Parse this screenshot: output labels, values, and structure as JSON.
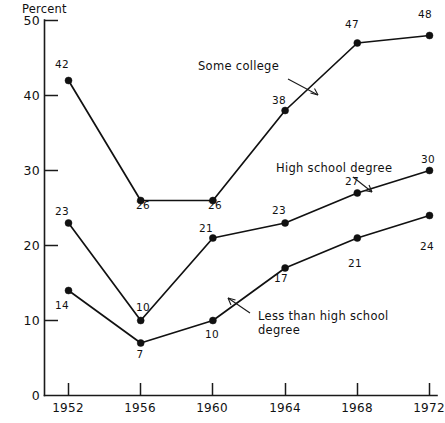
{
  "chart_data": {
    "type": "line",
    "title": "",
    "xlabel": "",
    "ylabel": "Percent",
    "ylim": [
      0,
      50
    ],
    "yticks": [
      0,
      10,
      20,
      30,
      40,
      50
    ],
    "ytick_labels": [
      "0",
      "10",
      "20",
      "30",
      "40",
      "50"
    ],
    "grid": false,
    "legend_position": "inline-annotations",
    "categories": [
      "1952",
      "1956",
      "1960",
      "1964",
      "1968",
      "1972"
    ],
    "x": [
      1952,
      1956,
      1960,
      1964,
      1968,
      1972
    ],
    "series": [
      {
        "name": "Some college",
        "values": [
          42,
          26,
          26,
          38,
          47,
          48
        ],
        "point_labels": [
          "42",
          "26",
          "26",
          "38",
          "47",
          "48"
        ]
      },
      {
        "name": "High school degree",
        "values": [
          23,
          10,
          21,
          23,
          27,
          30
        ],
        "point_labels": [
          "23",
          "10",
          "21",
          "23",
          "27",
          "30"
        ]
      },
      {
        "name": "Less than high school degree",
        "values": [
          14,
          7,
          10,
          17,
          21,
          24
        ],
        "point_labels": [
          "14",
          "7",
          "10",
          "17",
          "21",
          "24"
        ]
      }
    ],
    "annotations": [
      {
        "text": "Some college",
        "series": "Some college"
      },
      {
        "text": "High school degree",
        "series": "High school degree"
      },
      {
        "text": "Less than high school",
        "text2": "degree",
        "series": "Less than high school degree"
      }
    ]
  },
  "axis": {
    "y_title": "Percent",
    "y_labels": [
      "50",
      "40",
      "30",
      "20",
      "10",
      "0"
    ],
    "x_labels": [
      "1952",
      "1956",
      "1960",
      "1964",
      "1968",
      "1972"
    ]
  },
  "annotations": {
    "some_college": "Some college",
    "high_school": "High school degree",
    "less_than_hs_line1": "Less than high school",
    "less_than_hs_line2": "degree"
  },
  "labels": {
    "some_college": [
      "42",
      "26",
      "26",
      "38",
      "47",
      "48"
    ],
    "high_school": [
      "23",
      "10",
      "21",
      "23",
      "27",
      "30"
    ],
    "less_than_hs": [
      "14",
      "7",
      "10",
      "17",
      "21",
      "24"
    ]
  },
  "caption": {
    "text": ""
  },
  "colors": {
    "ink": "#111111",
    "background": "#ffffff"
  }
}
